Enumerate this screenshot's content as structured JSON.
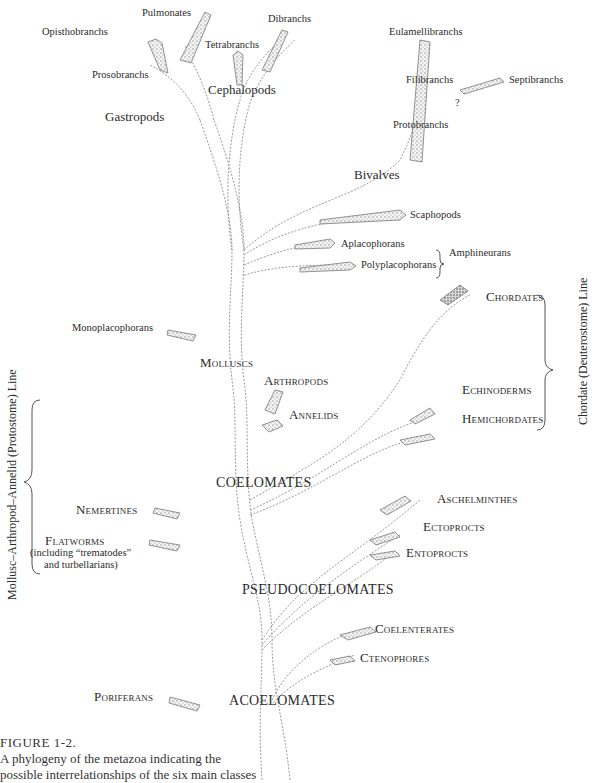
{
  "figure": {
    "label": "FIGURE 1-2.",
    "caption_line1": "A phylogeny of the metazoa indicating the",
    "caption_line2": "possible interrelationships of the six main classes"
  },
  "grades": {
    "acoelomates": "ACOELOMATES",
    "pseudocoelomates": "PSEUDOCOELOMATES",
    "coelomates": "COELOMATES"
  },
  "groups": {
    "molluscs": "Molluscs",
    "gastropods": "Gastropods",
    "cephalopods": "Cephalopods",
    "bivalves": "Bivalves",
    "arthropods": "Arthropods",
    "annelids": "Annelids",
    "chordates": "Chordates",
    "echinoderms": "Echinoderms",
    "hemichordates": "Hemichordates",
    "nemertines": "Nemertines",
    "flatworms": "Flatworms",
    "flatworms_note1": "(including “trematodes”",
    "flatworms_note2": "and turbellarians)",
    "aschelminthes": "Aschelminthes",
    "ectoprocts": "Ectoprocts",
    "entoprocts": "Entoprocts",
    "coelenterates": "Coelenterates",
    "ctenophores": "Ctenophores",
    "poriferans": "Poriferans",
    "monoplacophorans": "Monoplacophorans",
    "scaphopods": "Scaphopods",
    "aplacophorans": "Aplacophorans",
    "polyplacophorans": "Polyplacophorans",
    "amphineurans": "Amphineurans"
  },
  "subgroups": {
    "pulmonates": "Pulmonates",
    "opisthobranchs": "Opisthobranchs",
    "prosobranchs": "Prosobranchs",
    "tetrabranchs": "Tetrabranchs",
    "dibranchs": "Dibranchs",
    "eulamellibranchs": "Eulamellibranchs",
    "filibranchs": "Filibranchs",
    "protobranchs": "Protobranchs",
    "septibranchs": "Septibranchs",
    "question_mark": "?"
  },
  "lines": {
    "protostome": "Mollusc–Arthropod–Annelid (Protostome) Line",
    "deuterostome": "Chordate (Deuterostome) Line"
  }
}
